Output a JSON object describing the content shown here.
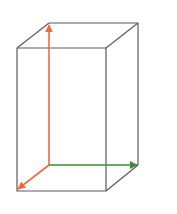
{
  "diagram": {
    "type": "3d-box-with-axes",
    "colors": {
      "edge": "#5a5a5a",
      "axis_vertical": "#f06a3c",
      "axis_depth": "#f06a3c",
      "axis_horizontal": "#3a8a3a",
      "background": "#ffffff"
    },
    "box": {
      "front_top_left": [
        17,
        48
      ],
      "front_top_right": [
        106,
        48
      ],
      "front_bottom_left": [
        17,
        191
      ],
      "front_bottom_right": [
        106,
        191
      ],
      "back_top_left": [
        49,
        23
      ],
      "back_top_right": [
        138,
        23
      ],
      "back_bottom_right": [
        138,
        165
      ]
    },
    "axes": {
      "origin": [
        49,
        165
      ],
      "vertical_end": [
        49,
        25
      ],
      "horizontal_end": [
        137,
        165
      ],
      "depth_end": [
        18,
        189
      ]
    }
  }
}
